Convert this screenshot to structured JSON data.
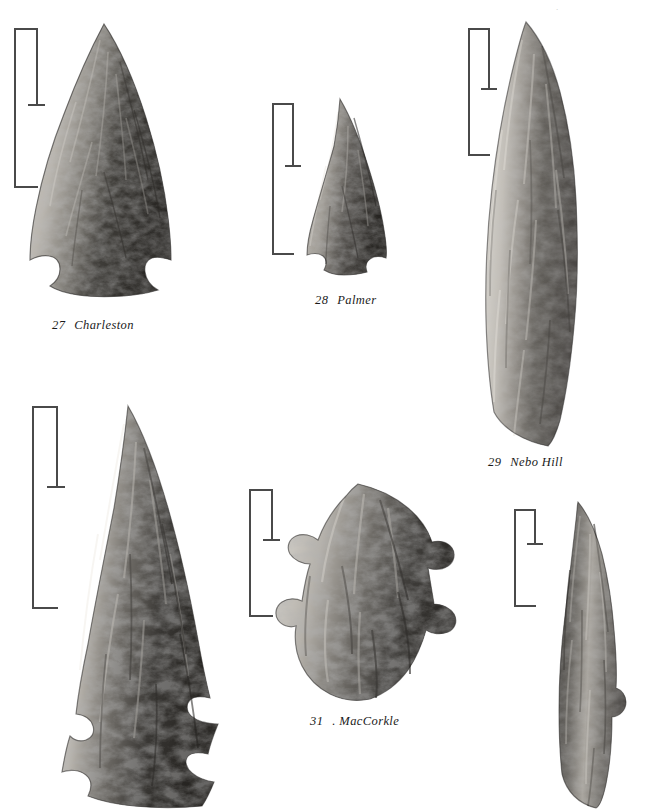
{
  "plate": {
    "background_color": "#ffffff",
    "ink_color": "#1a1a1a",
    "scale_bar_color": "#4a4a4a",
    "page_mark": "."
  },
  "captions": [
    {
      "id": "caption-27",
      "num": "27",
      "name": "Charleston",
      "full": "27  Charleston"
    },
    {
      "id": "caption-28",
      "num": "28",
      "name": "Palmer",
      "full": "28  Palmer"
    },
    {
      "id": "caption-29",
      "num": "29",
      "name": "Nebo Hill",
      "full": "29  Nebo Hill"
    },
    {
      "id": "caption-31",
      "num": "31",
      "name": ". MacCorkle",
      "full": "31 . MacCorkle"
    }
  ],
  "artifacts": [
    {
      "id": "artifact-27",
      "number": "27",
      "name": "Charleston",
      "form": "corner-notched triangular point with flared base",
      "caption_visible": true
    },
    {
      "id": "artifact-28",
      "number": "28",
      "name": "Palmer",
      "form": "small side-notched triangular point",
      "caption_visible": true
    },
    {
      "id": "artifact-29",
      "number": "29",
      "name": "Nebo Hill",
      "form": "long lanceolate blade with parallel flake scars",
      "caption_visible": true
    },
    {
      "id": "artifact-30",
      "number": "30",
      "name": "",
      "form": "large serrated bifurcate-base point, cropped at page edge",
      "caption_visible": false
    },
    {
      "id": "artifact-31",
      "number": "31",
      "name": "MacCorkle",
      "form": "bifurcated stemmed point with deep basal notch",
      "caption_visible": true
    },
    {
      "id": "artifact-32",
      "number": "32",
      "name": "",
      "form": "narrow stemmed lanceolate point, cropped at page edge",
      "caption_visible": false
    }
  ],
  "scale_bars": [
    {
      "id": "scale-27",
      "label": "scale-bar-charleston"
    },
    {
      "id": "scale-28",
      "label": "scale-bar-palmer"
    },
    {
      "id": "scale-29",
      "label": "scale-bar-nebo-hill"
    },
    {
      "id": "scale-30",
      "label": "scale-bar-artifact-30"
    },
    {
      "id": "scale-31",
      "label": "scale-bar-maccorkle"
    },
    {
      "id": "scale-32",
      "label": "scale-bar-artifact-32"
    }
  ]
}
